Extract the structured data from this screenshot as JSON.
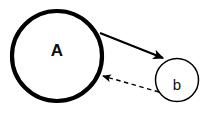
{
  "diagram": {
    "background_color": "#ffffff",
    "stroke_color": "#000000",
    "text_color": "#0d0d0d",
    "width": 215,
    "height": 123,
    "nodes": [
      {
        "id": "node-a",
        "label": "A",
        "shape": "circle",
        "cx": 57,
        "cy": 56,
        "r": 45,
        "stroke_width": 4.2,
        "fill": "#ffffff",
        "label_weight": "bold",
        "label_size": 17,
        "label_x": 57,
        "label_y": 52
      },
      {
        "id": "node-b",
        "label": "b",
        "shape": "circle",
        "cx": 177,
        "cy": 80,
        "r": 21.5,
        "stroke_width": 1.5,
        "fill": "#ffffff",
        "label_weight": "normal",
        "label_size": 15,
        "label_x": 177,
        "label_y": 86
      }
    ],
    "edges": [
      {
        "id": "edge-a-to-b",
        "from": "node-a",
        "to": "node-b",
        "style": "solid",
        "stroke_width": 2.2,
        "x1": 100,
        "y1": 33,
        "x2": 163,
        "y2": 58,
        "arrowhead": "filled-triangle",
        "direction": "A to b"
      },
      {
        "id": "edge-b-to-a",
        "from": "node-b",
        "to": "node-a",
        "style": "dashed",
        "stroke_width": 1.4,
        "dash_pattern": "4.5 3.5",
        "x1": 159,
        "y1": 92,
        "x2": 103,
        "y2": 76,
        "arrowhead": "filled-triangle",
        "direction": "b to A"
      }
    ]
  }
}
